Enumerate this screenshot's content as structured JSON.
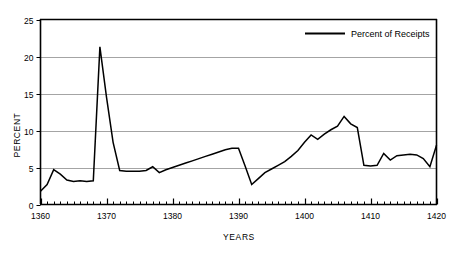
{
  "chart_data": {
    "type": "line",
    "title": "",
    "xlabel": "YEARS",
    "ylabel": "PERCENT",
    "xlim": [
      1360,
      1420
    ],
    "ylim": [
      0,
      25
    ],
    "yticks": [
      0,
      5,
      10,
      15,
      20,
      25
    ],
    "ytick_labels": [
      "0",
      "5",
      "10",
      "15",
      "20",
      "25"
    ],
    "xticks": [
      1360,
      1370,
      1380,
      1390,
      1400,
      1410,
      1420
    ],
    "xtick_labels": [
      "1360",
      "1370",
      "1380",
      "1390",
      "1400",
      "1410",
      "1420"
    ],
    "minor_xtick_interval": 1,
    "grid": "horizontal",
    "grid_color": "#9a9a9a",
    "line_color": "#000000",
    "legend_position": "top-right",
    "series": [
      {
        "name": "Percent of Receipts",
        "x": [
          1360,
          1361,
          1362,
          1363,
          1364,
          1365,
          1366,
          1367,
          1368,
          1369,
          1370,
          1371,
          1372,
          1373,
          1374,
          1375,
          1376,
          1377,
          1378,
          1379,
          1380,
          1381,
          1382,
          1383,
          1384,
          1385,
          1386,
          1387,
          1388,
          1389,
          1390,
          1391,
          1392,
          1393,
          1394,
          1395,
          1396,
          1397,
          1398,
          1399,
          1400,
          1401,
          1402,
          1403,
          1404,
          1405,
          1406,
          1407,
          1408,
          1409,
          1410,
          1411,
          1412,
          1413,
          1414,
          1415,
          1416,
          1417,
          1418,
          1419,
          1420
        ],
        "values": [
          1.8,
          2.7,
          4.7,
          4.1,
          3.3,
          3.1,
          3.2,
          3.1,
          3.2,
          21.3,
          14.5,
          8.4,
          4.6,
          4.5,
          4.5,
          4.5,
          4.6,
          5.1,
          4.3,
          4.7,
          5.0,
          5.3,
          5.6,
          5.9,
          6.2,
          6.5,
          6.8,
          7.1,
          7.4,
          7.6,
          7.6,
          5.2,
          2.7,
          3.5,
          4.3,
          4.8,
          5.3,
          5.8,
          6.5,
          7.3,
          8.4,
          9.4,
          8.8,
          9.5,
          10.1,
          10.6,
          11.9,
          10.9,
          10.4,
          5.3,
          5.2,
          5.3,
          6.9,
          6.0,
          6.6,
          6.7,
          6.8,
          6.7,
          6.2,
          5.1,
          8.0
        ]
      }
    ]
  },
  "legend": {
    "entries": [
      {
        "label": "Percent of Receipts"
      }
    ]
  },
  "axes": {
    "y_title": "PERCENT",
    "x_title": "YEARS"
  }
}
